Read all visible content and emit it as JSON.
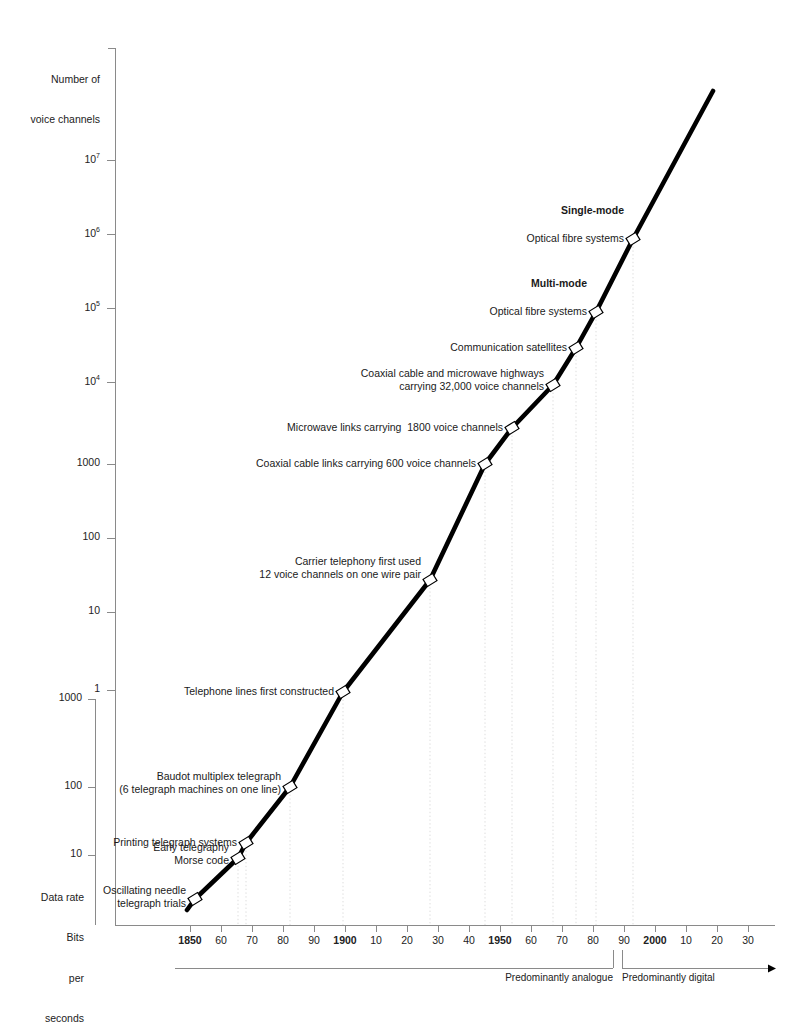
{
  "figure": {
    "background": "#ffffff",
    "line_color": "#000000",
    "marker_fill": "#ffffff",
    "marker_stroke": "#000000",
    "axis_color": "#6b6b6b",
    "grid_color": "#cccccc"
  },
  "axes": {
    "y_primary": {
      "title_lines": [
        "Number of",
        "voice channels"
      ],
      "ticks": [
        {
          "label": "10",
          "exp": "7",
          "y": 160
        },
        {
          "label": "10",
          "exp": "6",
          "y": 234
        },
        {
          "label": "10",
          "exp": "5",
          "y": 308
        },
        {
          "label": "10",
          "exp": "4",
          "y": 382
        },
        {
          "label": "1000",
          "exp": "",
          "y": 464
        },
        {
          "label": "100",
          "exp": "",
          "y": 538
        },
        {
          "label": "10",
          "exp": "",
          "y": 612
        },
        {
          "label": "1",
          "exp": "",
          "y": 690
        }
      ]
    },
    "y_secondary": {
      "title_lines": [
        "Data rate",
        "Bits",
        "per",
        "seconds"
      ],
      "ticks": [
        {
          "label": "1000",
          "y": 699
        },
        {
          "label": "100",
          "y": 787
        },
        {
          "label": "10",
          "y": 855
        }
      ]
    },
    "x_axis": {
      "y_pixel": 925,
      "ticks": [
        {
          "label": "1850",
          "bold": true,
          "x": 190
        },
        {
          "label": "60",
          "bold": false,
          "x": 221
        },
        {
          "label": "70",
          "bold": false,
          "x": 252
        },
        {
          "label": "80",
          "bold": false,
          "x": 283
        },
        {
          "label": "90",
          "bold": false,
          "x": 314
        },
        {
          "label": "1900",
          "bold": true,
          "x": 345
        },
        {
          "label": "10",
          "bold": false,
          "x": 376
        },
        {
          "label": "20",
          "bold": false,
          "x": 407
        },
        {
          "label": "30",
          "bold": false,
          "x": 438
        },
        {
          "label": "40",
          "bold": false,
          "x": 469
        },
        {
          "label": "1950",
          "bold": true,
          "x": 500
        },
        {
          "label": "60",
          "bold": false,
          "x": 531
        },
        {
          "label": "70",
          "bold": false,
          "x": 562
        },
        {
          "label": "80",
          "bold": false,
          "x": 593
        },
        {
          "label": "90",
          "bold": false,
          "x": 624
        },
        {
          "label": "2000",
          "bold": true,
          "x": 655
        },
        {
          "label": "10",
          "bold": false,
          "x": 686
        },
        {
          "label": "20",
          "bold": false,
          "x": 717
        },
        {
          "label": "30",
          "bold": false,
          "x": 748
        }
      ]
    },
    "eras": [
      {
        "label": "Predominantly analogue",
        "x_start": 175,
        "x_end": 613,
        "text_x": 613
      },
      {
        "label": "Predominantly digital",
        "x_start": 622,
        "x_end": 775,
        "text_x": 622
      }
    ]
  },
  "chart_data": {
    "type": "line",
    "title": "",
    "xlabel": "",
    "ylabel": "Number of voice channels",
    "xlim": [
      1840,
      2030
    ],
    "ylim_note": "Logarithmic, dual scale: upper = number of voice channels, lower = data rate bits per second",
    "grid": "vertical dotted gridlines at milestone years",
    "legend": "none",
    "points": [
      {
        "label": "Oscillating needle telegraph trials",
        "label_lines": [
          "Oscillating needle",
          "telegraph trials"
        ],
        "year": 1843,
        "px": 195,
        "py": 899,
        "value_note": "~2 bits per second"
      },
      {
        "label": "Early telegraphy Morse code",
        "label_lines": [
          "Early telegraphy",
          "Morse code"
        ],
        "year": 1857,
        "px": 238,
        "py": 858,
        "value_note": "~10 bits per second"
      },
      {
        "label": "Printing telegraph systems",
        "label_lines": [
          "Printing telegraph systems"
        ],
        "year": 1872,
        "px": 246,
        "py": 843,
        "value_note": "~20 bits per second"
      },
      {
        "label": "Baudot multiplex telegraph (6 telegraph machines on one line)",
        "label_lines": [
          "Baudot multiplex telegraph",
          "(6 telegraph machines on one line)"
        ],
        "year": 1878,
        "px": 290,
        "py": 787,
        "value_note": "~100 bits per second"
      },
      {
        "label": "Telephone lines first constructed",
        "label_lines": [
          "Telephone lines first constructed"
        ],
        "year": 1895,
        "px": 343,
        "py": 692,
        "value_note": "1 voice channel"
      },
      {
        "label": "Carrier telephony first used 12 voice channels on one wire pair",
        "label_lines": [
          "Carrier telephony first used",
          "12 voice channels on one wire pair"
        ],
        "year": 1925,
        "px": 430,
        "py": 580,
        "value_note": "12 voice channels"
      },
      {
        "label": "Coaxial cable links carrying 600 voice channels",
        "label_lines": [
          "Coaxial cable links carrying 600 voice channels"
        ],
        "year": 1944,
        "px": 485,
        "py": 464,
        "value_note": "600 voice channels"
      },
      {
        "label": "Microwave links carrying 1800 voice channels",
        "label_lines": [
          "Microwave links carrying  1800 voice channels"
        ],
        "year": 1953,
        "px": 512,
        "py": 428,
        "value_note": "1800 voice channels"
      },
      {
        "label": "Coaxial cable and microwave highways carrying 32,000 voice channels",
        "label_lines": [
          "Coaxial cable and microwave highways",
          "carrying 32,000 voice channels"
        ],
        "year": 1968,
        "px": 553,
        "py": 385,
        "value_note": "32,000 voice channels"
      },
      {
        "label": "Communication satellites",
        "label_lines": [
          "Communication satellites"
        ],
        "year": 1977,
        "px": 576,
        "py": 348,
        "value_note": "~40,000 voice channels"
      },
      {
        "label": "Multi-mode Optical fibre systems",
        "label_lines": [
          "Optical fibre systems"
        ],
        "heading": "Multi-mode",
        "year": 1983,
        "px": 596,
        "py": 312,
        "value_note": "10^5 voice channels"
      },
      {
        "label": "Single-mode Optical fibre systems",
        "label_lines": [
          "Optical fibre systems"
        ],
        "heading": "Single-mode",
        "year": 1995,
        "px": 633,
        "py": 239,
        "value_note": "10^6 voice channels"
      }
    ],
    "line_endpoints": {
      "start_px": [
        187,
        910
      ],
      "end_px": [
        713,
        91
      ]
    }
  },
  "annotations": [
    {
      "name": "annotation-single-mode",
      "heading": "Single-mode",
      "text": "Optical fibre systems",
      "heading_x": 624,
      "heading_y": 204,
      "text_x": 624,
      "text_y": 232
    },
    {
      "name": "annotation-multi-mode",
      "heading": "Multi-mode",
      "text": "Optical fibre systems",
      "heading_x": 587,
      "heading_y": 277,
      "text_x": 587,
      "text_y": 305
    },
    {
      "name": "annotation-communication-satellites",
      "text": "Communication satellites",
      "text_x": 567,
      "text_y": 341
    },
    {
      "name": "annotation-coaxial-microwave-highways",
      "line1": "Coaxial cable and microwave highways",
      "line2": "carrying 32,000 voice channels",
      "text_x": 544,
      "text_y": 367
    },
    {
      "name": "annotation-microwave-links",
      "text": "Microwave links carrying  1800 voice channels",
      "text_x": 503,
      "text_y": 421
    },
    {
      "name": "annotation-coaxial-cable-links",
      "text": "Coaxial cable links carrying 600 voice channels",
      "text_x": 476,
      "text_y": 457
    },
    {
      "name": "annotation-carrier-telephony",
      "line1": "Carrier telephony first used",
      "line2": "12 voice channels on one wire pair",
      "text_x": 421,
      "text_y": 555
    },
    {
      "name": "annotation-telephone-lines",
      "text": "Telephone lines first constructed",
      "text_x": 334,
      "text_y": 685
    },
    {
      "name": "annotation-baudot-multiplex",
      "line1": "Baudot multiplex telegraph",
      "line2": "(6 telegraph machines on one line)",
      "text_x": 281,
      "text_y": 770
    },
    {
      "name": "annotation-printing-telegraph",
      "text": "Printing telegraph systems",
      "text_x": 237,
      "text_y": 836
    },
    {
      "name": "annotation-early-telegraphy",
      "line1": "Early telegraphy",
      "line2": "Morse code",
      "text_x": 229,
      "text_y": 841
    },
    {
      "name": "annotation-oscillating-needle",
      "line1": "Oscillating needle",
      "line2": "telegraph trials",
      "text_x": 186,
      "text_y": 884
    }
  ]
}
